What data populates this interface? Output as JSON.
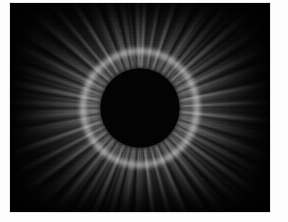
{
  "image": {
    "subject": "Total solar eclipse corona",
    "caption": "",
    "alt_text": "Total solar eclipse showing the black lunar disk surrounded by the white radial solar corona against a black sky",
    "frame": {
      "border_color": "#e8e8e8",
      "margin_color": "#fdfdfd",
      "width_px": 262,
      "height_px": 211
    },
    "scene": {
      "background_color": "#030303",
      "corona_color": "#ffffff",
      "occulting_disk_color": "#000000",
      "occulting_disk_label": "lunar-disk",
      "corona_label": "solar-corona",
      "sky_label": "night-sky"
    },
    "geometry": {
      "disk_center_x": 143,
      "disk_center_y": 105,
      "disk_radius_px": 40,
      "corona_outer_radius_px": 130
    },
    "features": [
      {
        "name": "lunar-silhouette",
        "description": "Black circular occulting disk at center"
      },
      {
        "name": "inner-corona",
        "description": "Bright white ring hugging the solar limb"
      },
      {
        "name": "polar-plumes",
        "description": "Fine radial streamers above and below the disk"
      },
      {
        "name": "equatorial-streamers",
        "description": "Broad bright streamers extending left and right"
      },
      {
        "name": "outer-corona-haze",
        "description": "Faint diffuse glow fading into the dark sky"
      }
    ]
  }
}
